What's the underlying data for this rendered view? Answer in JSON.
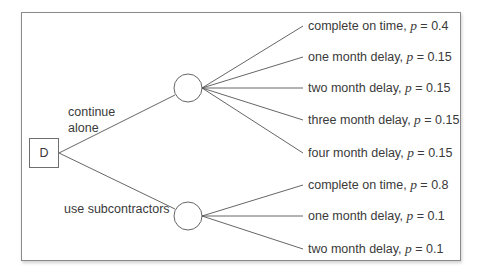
{
  "diagram": {
    "type": "decision-tree",
    "decision_node": {
      "label": "D"
    },
    "options": [
      {
        "label_lines": [
          "continue",
          "alone"
        ],
        "outcomes": [
          {
            "text": "complete on time, ",
            "p_symbol": "p",
            "eq": " = 0.4"
          },
          {
            "text": "one month delay, ",
            "p_symbol": "p",
            "eq": " = 0.15"
          },
          {
            "text": "two month delay, ",
            "p_symbol": "p",
            "eq": " = 0.15"
          },
          {
            "text": "three month delay, ",
            "p_symbol": "p",
            "eq": " = 0.15"
          },
          {
            "text": "four month delay, ",
            "p_symbol": "p",
            "eq": " = 0.15"
          }
        ]
      },
      {
        "label_lines": [
          "use subcontractors"
        ],
        "outcomes": [
          {
            "text": "complete on time, ",
            "p_symbol": "p",
            "eq": " = 0.8"
          },
          {
            "text": "one month delay, ",
            "p_symbol": "p",
            "eq": " = 0.1"
          },
          {
            "text": "two month delay, ",
            "p_symbol": "p",
            "eq": " = 0.1"
          }
        ]
      }
    ],
    "colors": {
      "line": "#555555",
      "text": "#3a3a3a",
      "frame": "#8a8a8a"
    }
  }
}
